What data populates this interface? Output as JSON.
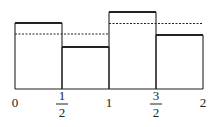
{
  "diagram": {
    "type": "step-function refinement",
    "x_axis": {
      "ticks": [
        {
          "value": 0,
          "label": "0"
        },
        {
          "value": 0.5,
          "label_num": "1",
          "label_den": "2"
        },
        {
          "value": 1,
          "label": "1"
        },
        {
          "value": 1.5,
          "label_num": "3",
          "label_den": "2"
        },
        {
          "value": 2,
          "label": "2"
        }
      ]
    },
    "fine_bars": [
      {
        "x0": 0,
        "x1": 0.5,
        "height": 66
      },
      {
        "x0": 0.5,
        "x1": 1,
        "height": 42
      },
      {
        "x0": 1,
        "x1": 1.5,
        "height": 77
      },
      {
        "x0": 1.5,
        "x1": 2,
        "height": 54
      }
    ],
    "coarse_dashed": [
      {
        "x0": 0,
        "x1": 1,
        "height": 55
      },
      {
        "x0": 1,
        "x1": 2,
        "height": 65.5
      }
    ],
    "colors": {
      "stroke": "#222222",
      "background": "#ffffff"
    }
  }
}
